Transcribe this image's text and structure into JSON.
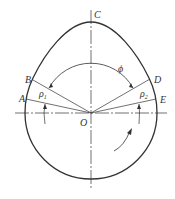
{
  "diagram": {
    "type": "cam profile",
    "colors": {
      "stroke": "#333333",
      "background": "#ffffff"
    },
    "labels": {
      "C": "C",
      "B": "B",
      "A": "A",
      "D": "D",
      "E": "E",
      "O": "O",
      "phi": "ϕ",
      "rho1_base": "ρ",
      "rho1_sub": "1",
      "rho2_base": "ρ",
      "rho2_sub": "2"
    },
    "points": {
      "O": [
        91,
        113
      ],
      "C": [
        91,
        22
      ],
      "B": [
        33,
        80
      ],
      "A": [
        27,
        99
      ],
      "D": [
        150,
        80
      ],
      "E": [
        156,
        99
      ]
    },
    "rotation_arrow": "counterclockwise-rotation-indicator"
  }
}
